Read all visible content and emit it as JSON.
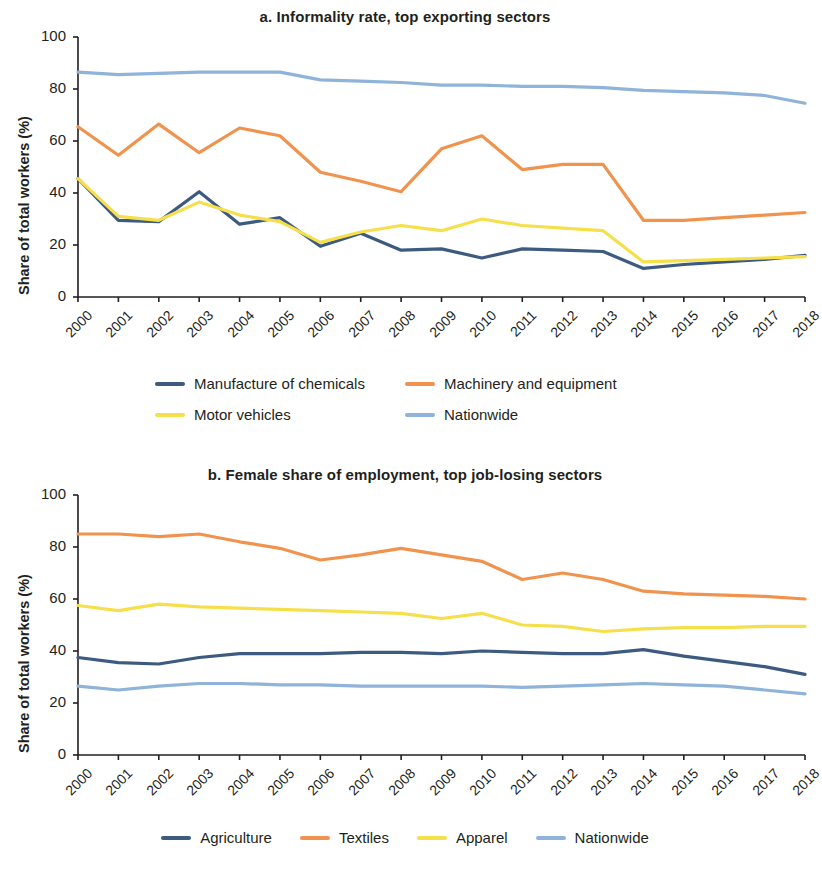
{
  "figure": {
    "ylabel": "Share of total workers (%)"
  },
  "panels": [
    {
      "title": "a. Informality rate, top exporting sectors",
      "legend_rows": [
        [
          {
            "label": "Manufacture of chemicals",
            "color": "#3d5a80"
          },
          {
            "label": "Machinery and equipment",
            "color": "#f0934e"
          }
        ],
        [
          {
            "label": "Motor vehicles",
            "color": "#f5e04b"
          },
          {
            "label": "Nationwide",
            "color": "#8fb3d9"
          }
        ]
      ]
    },
    {
      "title": "b. Female share of employment, top job-losing sectors",
      "legend_rows": [
        [
          {
            "label": "Agriculture",
            "color": "#3d5a80"
          },
          {
            "label": "Textiles",
            "color": "#f0934e"
          },
          {
            "label": "Apparel",
            "color": "#f5e04b"
          },
          {
            "label": "Nationwide",
            "color": "#8fb3d9"
          }
        ]
      ]
    }
  ],
  "chart_data": [
    {
      "type": "line",
      "title": "a. Informality rate, top exporting sectors",
      "xlabel": "",
      "ylabel": "Share of total workers (%)",
      "ylim": [
        0,
        100
      ],
      "yticks": [
        0,
        20,
        40,
        60,
        80,
        100
      ],
      "grid": false,
      "legend_position": "below",
      "categories": [
        "2000",
        "2001",
        "2002",
        "2003",
        "2004",
        "2005",
        "2006",
        "2007",
        "2008",
        "2009",
        "2010",
        "2011",
        "2012",
        "2013",
        "2014",
        "2015",
        "2016",
        "2017",
        "2018"
      ],
      "series": [
        {
          "name": "Manufacture of chemicals",
          "color": "#3d5a80",
          "values": [
            45.5,
            29.5,
            29.0,
            40.5,
            28.0,
            30.5,
            19.5,
            24.5,
            18.0,
            18.5,
            15.0,
            18.5,
            18.0,
            17.5,
            11.0,
            12.5,
            13.5,
            14.5,
            16.0
          ]
        },
        {
          "name": "Machinery and equipment",
          "color": "#f0934e",
          "values": [
            65.5,
            54.5,
            66.5,
            55.5,
            65.0,
            62.0,
            48.0,
            44.5,
            40.5,
            57.0,
            62.0,
            49.0,
            51.0,
            51.0,
            29.5,
            29.5,
            30.5,
            31.5,
            32.5
          ]
        },
        {
          "name": "Motor vehicles",
          "color": "#f5e04b",
          "values": [
            45.5,
            31.0,
            29.5,
            36.5,
            31.5,
            29.0,
            21.0,
            25.0,
            27.5,
            25.5,
            30.0,
            27.5,
            26.5,
            25.5,
            13.5,
            14.0,
            14.5,
            15.0,
            15.5
          ]
        },
        {
          "name": "Nationwide",
          "color": "#8fb3d9",
          "values": [
            86.5,
            85.5,
            86.0,
            86.5,
            86.5,
            86.5,
            83.5,
            83.0,
            82.5,
            81.5,
            81.5,
            81.0,
            81.0,
            80.5,
            79.5,
            79.0,
            78.5,
            77.5,
            74.5
          ]
        }
      ]
    },
    {
      "type": "line",
      "title": "b. Female share of employment, top job-losing sectors",
      "xlabel": "",
      "ylabel": "Share of total workers (%)",
      "ylim": [
        0,
        100
      ],
      "yticks": [
        0,
        20,
        40,
        60,
        80,
        100
      ],
      "grid": false,
      "legend_position": "below",
      "categories": [
        "2000",
        "2001",
        "2002",
        "2003",
        "2004",
        "2005",
        "2006",
        "2007",
        "2008",
        "2009",
        "2010",
        "2011",
        "2012",
        "2013",
        "2014",
        "2015",
        "2016",
        "2017",
        "2018"
      ],
      "series": [
        {
          "name": "Agriculture",
          "color": "#3d5a80",
          "values": [
            37.5,
            35.5,
            35.0,
            37.5,
            39.0,
            39.0,
            39.0,
            39.5,
            39.5,
            39.0,
            40.0,
            39.5,
            39.0,
            39.0,
            40.5,
            38.0,
            36.0,
            34.0,
            31.0
          ]
        },
        {
          "name": "Textiles",
          "color": "#f0934e",
          "values": [
            85.0,
            85.0,
            84.0,
            85.0,
            82.0,
            79.5,
            75.0,
            77.0,
            79.5,
            77.0,
            74.5,
            67.5,
            70.0,
            67.5,
            63.0,
            62.0,
            61.5,
            61.0,
            60.0
          ]
        },
        {
          "name": "Apparel",
          "color": "#f5e04b",
          "values": [
            57.5,
            55.5,
            58.0,
            57.0,
            56.5,
            56.0,
            55.5,
            55.0,
            54.5,
            52.5,
            54.5,
            50.0,
            49.5,
            47.5,
            48.5,
            49.0,
            49.0,
            49.5,
            49.5
          ]
        },
        {
          "name": "Nationwide",
          "color": "#8fb3d9",
          "values": [
            26.5,
            25.0,
            26.5,
            27.5,
            27.5,
            27.0,
            27.0,
            26.5,
            26.5,
            26.5,
            26.5,
            26.0,
            26.5,
            27.0,
            27.5,
            27.0,
            26.5,
            25.0,
            23.5
          ]
        }
      ]
    }
  ]
}
